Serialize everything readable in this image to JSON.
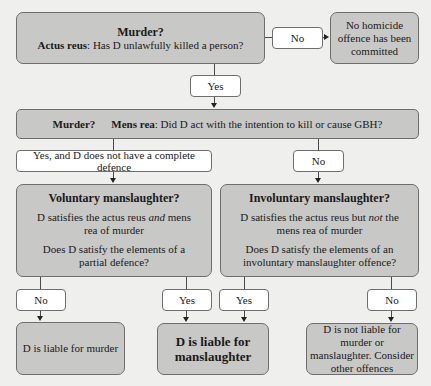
{
  "colors": {
    "box_fill": "#c8c8c6",
    "label_fill": "#ffffff",
    "border": "#6e6e6e",
    "background": "#efefed"
  },
  "nodes": {
    "actus_reus": {
      "title": "Murder?",
      "label_bold": "Actus reus",
      "question": ": Has D unlawfully killed a person?"
    },
    "no_homicide": {
      "text": "No homicide offence has been committed"
    },
    "mens_rea": {
      "title": "Murder?",
      "label_bold": "Mens rea",
      "question": ": Did D act with the intention to kill or cause GBH?"
    },
    "voluntary": {
      "title": "Voluntary manslaughter?",
      "line1_a": "D satisfies the actus reus ",
      "line1_em": "and",
      "line1_b": " mens rea of murder",
      "line2": "Does D satisfy the elements of a partial defence?"
    },
    "involuntary": {
      "title": "Involuntary manslaughter?",
      "line1_a": "D satisfies the actus reus but ",
      "line1_em": "not",
      "line1_b": " the mens rea of murder",
      "line2": "Does D satisfy the elements of an involuntary manslaughter offence?"
    },
    "liable_murder": {
      "text": "D is liable for murder"
    },
    "liable_manslaughter": {
      "text": "D is liable for manslaughter"
    },
    "not_liable": {
      "text": "D is not liable for murder or manslaughter. Consider other offences"
    }
  },
  "edges": {
    "actus_no": "No",
    "actus_yes": "Yes",
    "mens_yes": "Yes, and D does not have a complete defence",
    "mens_no": "No",
    "vol_no": "No",
    "vol_yes": "Yes",
    "invol_yes": "Yes",
    "invol_no": "No"
  }
}
